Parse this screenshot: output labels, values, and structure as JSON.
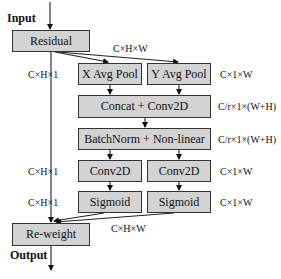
{
  "diagram": {
    "input_label": "Input",
    "output_label": "Output",
    "boxes": {
      "residual": "Residual",
      "x_avg_pool": "X Avg Pool",
      "y_avg_pool": "Y Avg Pool",
      "concat_conv": "Concat + Conv2D",
      "batchnorm": "BatchNorm + Non-linear",
      "conv_left": "Conv2D",
      "conv_right": "Conv2D",
      "sigmoid_left": "Sigmoid",
      "sigmoid_right": "Sigmoid",
      "reweight": "Re-weight"
    },
    "dims": {
      "residual_out": "C×H×W",
      "x_pool_left": "C×H×1",
      "y_pool_right": "C×1×W",
      "concat_right": "C/r×1×(W+H)",
      "batchnorm_right": "C/r×1×(W+H)",
      "conv_left": "C×H×1",
      "conv_right": "C×1×W",
      "sigmoid_left": "C×H×1",
      "sigmoid_right": "C×1×W",
      "reweight_in": "C×H×W"
    },
    "colors": {
      "box_fill": "#d3d3d3",
      "stroke": "#333333"
    }
  }
}
